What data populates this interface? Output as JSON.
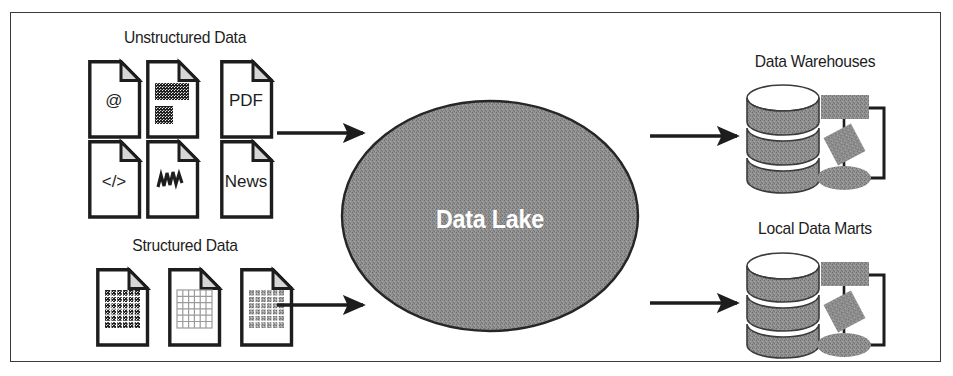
{
  "diagram": {
    "colors": {
      "outline": "#1d1d1d",
      "frame_border": "#3a3a3a",
      "lake_fill": "#8c8c8c",
      "shape_fill": "#9a9a9a",
      "background": "#ffffff",
      "lake_label_color": "#ffffff"
    }
  },
  "groups": {
    "unstructured": {
      "label": "Unstructured Data",
      "documents": [
        {
          "id": "email",
          "glyph": "@",
          "icon": "email-document-icon"
        },
        {
          "id": "image",
          "glyph": "",
          "icon": "image-document-icon"
        },
        {
          "id": "pdf",
          "glyph": "PDF",
          "icon": "pdf-document-icon"
        },
        {
          "id": "code",
          "glyph": "</>",
          "icon": "code-document-icon"
        },
        {
          "id": "audio",
          "glyph": "",
          "icon": "audio-waveform-document-icon"
        },
        {
          "id": "news",
          "glyph": "News",
          "icon": "news-document-icon"
        }
      ]
    },
    "structured": {
      "label": "Structured Data",
      "documents": [
        {
          "id": "dense-table",
          "glyph": "",
          "icon": "dense-grid-document-icon"
        },
        {
          "id": "empty-table",
          "glyph": "",
          "icon": "outline-grid-document-icon"
        },
        {
          "id": "shaded-table",
          "glyph": "",
          "icon": "shaded-grid-document-icon"
        }
      ]
    }
  },
  "lake": {
    "label": "Data Lake"
  },
  "outputs": [
    {
      "id": "data-warehouses",
      "label": "Data Warehouses"
    },
    {
      "id": "local-data-marts",
      "label": "Local Data Marts"
    }
  ],
  "arrows": [
    {
      "id": "unstructured-to-lake",
      "from": "Unstructured Data",
      "to": "Data Lake"
    },
    {
      "id": "structured-to-lake",
      "from": "Structured Data",
      "to": "Data Lake"
    },
    {
      "id": "lake-to-warehouses",
      "from": "Data Lake",
      "to": "Data Warehouses"
    },
    {
      "id": "lake-to-marts",
      "from": "Data Lake",
      "to": "Local Data Marts"
    }
  ]
}
